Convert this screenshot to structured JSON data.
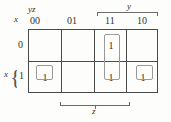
{
  "diagram": {
    "type": "karnaugh-map",
    "variables": [
      "x",
      "y",
      "z"
    ],
    "row_variable_label": "x",
    "column_variable_label": "yz",
    "column_headers": [
      "00",
      "01",
      "11",
      "10"
    ],
    "row_headers": [
      "0",
      "1"
    ],
    "group_labels": {
      "top": "y",
      "bottom": "z",
      "left_brace": "x"
    },
    "cells": [
      {
        "row": "0",
        "col": "00",
        "value": "",
        "grouped": false
      },
      {
        "row": "0",
        "col": "01",
        "value": "",
        "grouped": false
      },
      {
        "row": "0",
        "col": "11",
        "value": "1",
        "grouped": true
      },
      {
        "row": "0",
        "col": "10",
        "value": "",
        "grouped": false
      },
      {
        "row": "1",
        "col": "00",
        "value": "1",
        "grouped": true
      },
      {
        "row": "1",
        "col": "01",
        "value": "",
        "grouped": false
      },
      {
        "row": "1",
        "col": "11",
        "value": "1",
        "grouped": true
      },
      {
        "row": "1",
        "col": "10",
        "value": "1",
        "grouped": true
      }
    ],
    "groups": [
      {
        "name": "group-00",
        "cells": [
          "x=1,yz=00"
        ],
        "size": 1
      },
      {
        "name": "group-11",
        "cells": [
          "x=0,yz=11",
          "x=1,yz=11"
        ],
        "size": 2
      },
      {
        "name": "group-10",
        "cells": [
          "x=1,yz=10"
        ],
        "size": 1
      }
    ]
  },
  "colors": {
    "background": "#fdfdfc",
    "grid_line": "#4a4a4a",
    "group_box": "#9a9a9a",
    "bracket": "#6a6a6a",
    "text": "#2f2d2b"
  },
  "glyphs": {
    "left_brace": "{"
  }
}
